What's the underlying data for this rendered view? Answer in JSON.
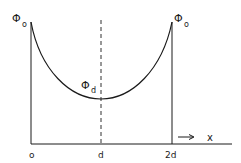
{
  "diagram": {
    "curve_label_left": {
      "symbol": "Φ",
      "sub": "o"
    },
    "curve_label_right": {
      "symbol": "Φ",
      "sub": "o"
    },
    "curve_label_min": {
      "symbol": "Φ",
      "sub": "d"
    },
    "x_ticks": [
      "o",
      "d",
      "2d"
    ],
    "x_axis_label": "x",
    "arrow": "→"
  }
}
